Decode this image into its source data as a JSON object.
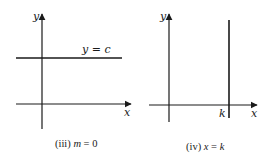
{
  "panels": [
    {
      "id": "iii",
      "caption_prefix": "(iii) ",
      "caption_var": "m",
      "caption_rest": " = 0",
      "axis_labels": {
        "x": "x",
        "y": "y"
      },
      "line_label": "y = c",
      "line_type": "horizontal"
    },
    {
      "id": "iv",
      "caption_prefix": "(iv) ",
      "caption_var": "x",
      "caption_mid": " = ",
      "caption_var2": "k",
      "axis_labels": {
        "x": "x",
        "y": "y"
      },
      "tick_label": "k",
      "line_type": "vertical"
    }
  ],
  "colors": {
    "ink": "#1a1a1a",
    "background": "#ffffff"
  }
}
